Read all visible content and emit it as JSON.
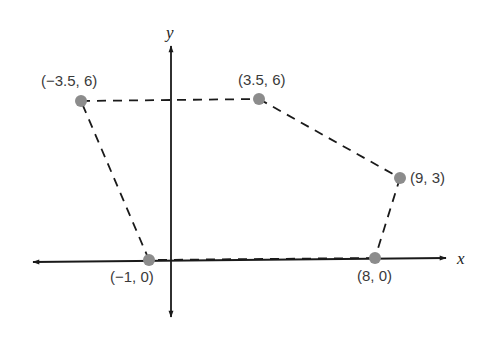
{
  "diagram": {
    "type": "coordinate-plane-polygon",
    "axes": {
      "x_label": "x",
      "y_label": "y",
      "color": "#1a1a1a"
    },
    "polygon": {
      "edge_style": "dashed",
      "edge_color": "#1a1a1a",
      "vertex_color": "#8c8c8c",
      "vertices": [
        {
          "label": "(−3.5, 6)",
          "x": -3.5,
          "y": 6
        },
        {
          "label": "(3.5, 6)",
          "x": 3.5,
          "y": 6
        },
        {
          "label": "(9, 3)",
          "x": 9,
          "y": 3
        },
        {
          "label": "(8, 0)",
          "x": 8,
          "y": 0
        },
        {
          "label": "(−1, 0)",
          "x": -1,
          "y": 0
        }
      ]
    }
  }
}
